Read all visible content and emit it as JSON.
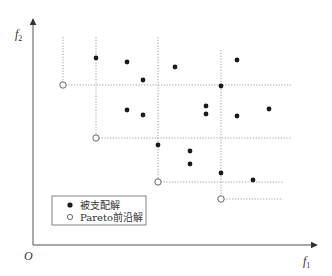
{
  "diagram": {
    "type": "pareto-front-illustration",
    "origin_label": "O",
    "x_axis": {
      "label": "f",
      "subscript": "1"
    },
    "y_axis": {
      "label": "f",
      "subscript": "2"
    },
    "legend": {
      "items": [
        {
          "marker": "filled-circle",
          "label": "被支配解"
        },
        {
          "marker": "open-circle",
          "label": "Pareto前沿解"
        }
      ]
    },
    "pareto_points": [
      {
        "x": 63,
        "y": 85
      },
      {
        "x": 96,
        "y": 138
      },
      {
        "x": 158,
        "y": 182
      },
      {
        "x": 221,
        "y": 199
      }
    ],
    "dominated_points": [
      {
        "x": 96,
        "y": 58
      },
      {
        "x": 127,
        "y": 62
      },
      {
        "x": 143,
        "y": 80
      },
      {
        "x": 175,
        "y": 67
      },
      {
        "x": 237,
        "y": 60
      },
      {
        "x": 221,
        "y": 86
      },
      {
        "x": 127,
        "y": 110
      },
      {
        "x": 143,
        "y": 115
      },
      {
        "x": 206,
        "y": 106
      },
      {
        "x": 206,
        "y": 114
      },
      {
        "x": 237,
        "y": 116
      },
      {
        "x": 269,
        "y": 109
      },
      {
        "x": 158,
        "y": 145
      },
      {
        "x": 190,
        "y": 151
      },
      {
        "x": 190,
        "y": 164
      },
      {
        "x": 221,
        "y": 173
      },
      {
        "x": 253,
        "y": 180
      }
    ],
    "dashed_guides": {
      "vertical": [
        {
          "x": 63,
          "y1": 37,
          "y2": 85
        },
        {
          "x": 96,
          "y1": 37,
          "y2": 138
        },
        {
          "x": 158,
          "y1": 37,
          "y2": 182
        },
        {
          "x": 221,
          "y1": 50,
          "y2": 199
        }
      ],
      "horizontal": [
        {
          "y": 85,
          "x1": 63,
          "x2": 291
        },
        {
          "y": 138,
          "x1": 96,
          "x2": 292
        },
        {
          "y": 182,
          "x1": 158,
          "x2": 283
        },
        {
          "y": 199,
          "x1": 221,
          "x2": 283
        }
      ]
    },
    "colors": {
      "axis": "#555555",
      "guide": "#888888",
      "dot": "#1a1a1a",
      "open": "#ffffff"
    }
  }
}
